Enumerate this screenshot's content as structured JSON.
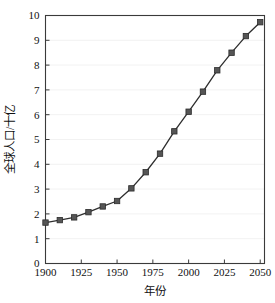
{
  "chart_data": {
    "type": "line",
    "title": "",
    "xlabel": "年份",
    "ylabel": "全球人口/十亿",
    "xlim": [
      1900,
      2053
    ],
    "ylim": [
      0,
      10
    ],
    "grid": true,
    "legend": false,
    "marker": "square",
    "line_color": "#2e2e2e",
    "marker_color": "#555555",
    "grid_color": "#f0f0f0",
    "axis_color": "#3a3a3a",
    "background": "#ffffff",
    "xticks": [
      1900,
      1925,
      1950,
      1975,
      2000,
      2025,
      2050
    ],
    "xtick_labels": [
      "1900",
      "1925",
      "1950",
      "1975",
      "2000",
      "2025",
      "2050"
    ],
    "yticks": [
      0,
      1,
      2,
      3,
      4,
      5,
      6,
      7,
      8,
      9,
      10
    ],
    "ytick_labels": [
      "0",
      "1",
      "2",
      "3",
      "4",
      "5",
      "6",
      "7",
      "8",
      "9",
      "10"
    ],
    "x": [
      1900,
      1910,
      1920,
      1930,
      1940,
      1950,
      1960,
      1970,
      1980,
      1990,
      2000,
      2010,
      2020,
      2030,
      2040,
      2050
    ],
    "values": [
      1.65,
      1.75,
      1.86,
      2.07,
      2.3,
      2.52,
      3.03,
      3.68,
      4.43,
      5.33,
      6.12,
      6.93,
      7.79,
      8.5,
      9.17,
      9.73
    ],
    "series": [
      {
        "name": "全球人口",
        "values": [
          1.65,
          1.75,
          1.86,
          2.07,
          2.3,
          2.52,
          3.03,
          3.68,
          4.43,
          5.33,
          6.12,
          6.93,
          7.79,
          8.5,
          9.17,
          9.73
        ]
      }
    ]
  }
}
